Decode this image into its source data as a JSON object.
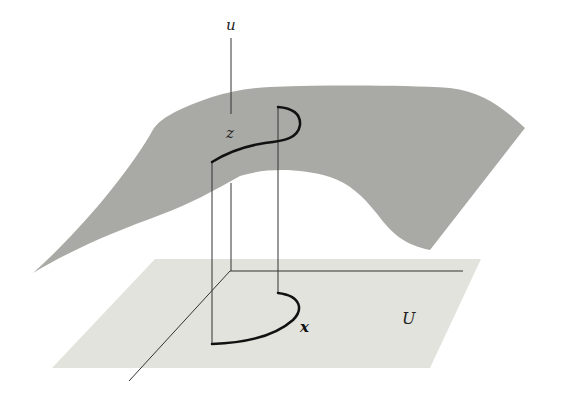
{
  "diagram": {
    "labels": {
      "u_axis": "u",
      "z_point": "z",
      "x_point": "x",
      "domain": "U"
    },
    "colors": {
      "surface": "#a9aaa6",
      "plane": "#e2e3dc",
      "axis": "#333333",
      "curve": "#111111"
    },
    "elements": [
      "graph surface (grey) over domain",
      "base plane U (light)",
      "vertical u-axis",
      "horizontal and diagonal axes in base plane",
      "curve z on surface with vertical projection lines",
      "curve x in domain U"
    ]
  }
}
